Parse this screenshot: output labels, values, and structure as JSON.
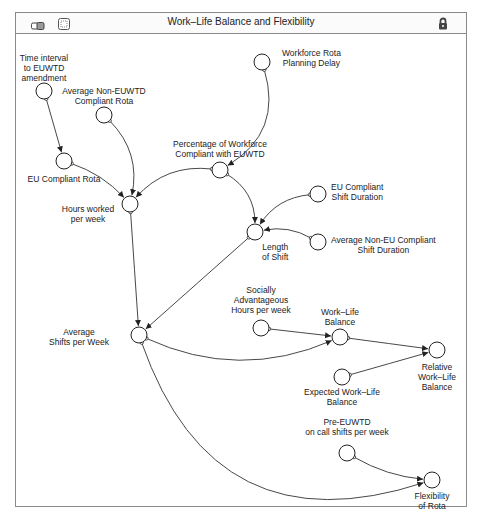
{
  "window": {
    "title": "Work–Life Balance and Flexibility",
    "icons": [
      "model-view-icon",
      "frame-icon",
      "lock-icon"
    ]
  },
  "diagram": {
    "type": "causal-loop",
    "nodes": [
      {
        "id": "time_interval",
        "label": "Time interval\nto EUWTD\namendment",
        "x": 44,
        "y": 91
      },
      {
        "id": "avg_non_euwtd_rota",
        "label": "Average Non-EUWTD\nCompliant Rota",
        "x": 104,
        "y": 115
      },
      {
        "id": "workforce_delay",
        "label": "Workforce Rota\nPlanning Delay",
        "x": 262,
        "y": 62
      },
      {
        "id": "eu_compliant_rota",
        "label": "EU Compliant Rota",
        "x": 64,
        "y": 161
      },
      {
        "id": "pct_compliant",
        "label": "Percentage of Workforce\nCompliant with EUWTD",
        "x": 220,
        "y": 170
      },
      {
        "id": "hours_worked",
        "label": "Hours worked\nper week",
        "x": 130,
        "y": 204
      },
      {
        "id": "eu_shift_duration",
        "label": "EU Compliant\nShift Duration",
        "x": 318,
        "y": 194
      },
      {
        "id": "length_of_shift",
        "label": "Length\nof Shift",
        "x": 255,
        "y": 232
      },
      {
        "id": "avg_non_eu_shift",
        "label": "Average Non-EU Compliant\nShift Duration",
        "x": 318,
        "y": 242
      },
      {
        "id": "avg_shifts",
        "label": "Average\nShifts per Week",
        "x": 139,
        "y": 335
      },
      {
        "id": "social_hours",
        "label": "Socially\nAdvantageous\nHours per week",
        "x": 261,
        "y": 328
      },
      {
        "id": "wlb",
        "label": "Work–Life\nBalance",
        "x": 340,
        "y": 337
      },
      {
        "id": "relative_wlb",
        "label": "Relative\nWork–Life\nBalance",
        "x": 437,
        "y": 350
      },
      {
        "id": "expected_wlb",
        "label": "Expected Work–Life\nBalance",
        "x": 342,
        "y": 377
      },
      {
        "id": "pre_euwtd",
        "label": "Pre-EUWTD\non call shifts per week",
        "x": 347,
        "y": 453
      },
      {
        "id": "flexibility",
        "label": "Flexibility\nof Rota",
        "x": 432,
        "y": 480
      }
    ],
    "links": [
      {
        "from": "time_interval",
        "to": "eu_compliant_rota"
      },
      {
        "from": "eu_compliant_rota",
        "to": "hours_worked"
      },
      {
        "from": "avg_non_euwtd_rota",
        "to": "hours_worked"
      },
      {
        "from": "pct_compliant",
        "to": "hours_worked"
      },
      {
        "from": "workforce_delay",
        "to": "pct_compliant"
      },
      {
        "from": "pct_compliant",
        "to": "length_of_shift"
      },
      {
        "from": "eu_shift_duration",
        "to": "length_of_shift"
      },
      {
        "from": "avg_non_eu_shift",
        "to": "length_of_shift"
      },
      {
        "from": "hours_worked",
        "to": "avg_shifts"
      },
      {
        "from": "length_of_shift",
        "to": "avg_shifts"
      },
      {
        "from": "avg_shifts",
        "to": "wlb"
      },
      {
        "from": "social_hours",
        "to": "wlb"
      },
      {
        "from": "wlb",
        "to": "relative_wlb"
      },
      {
        "from": "expected_wlb",
        "to": "relative_wlb"
      },
      {
        "from": "avg_shifts",
        "to": "flexibility"
      },
      {
        "from": "pre_euwtd",
        "to": "flexibility"
      }
    ]
  }
}
